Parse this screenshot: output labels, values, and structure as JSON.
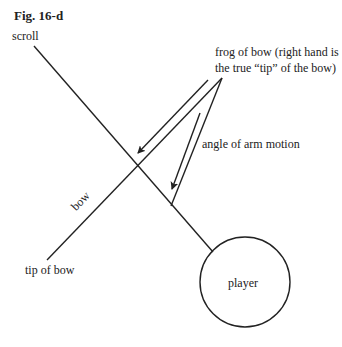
{
  "figure": {
    "title": "Fig. 16-d"
  },
  "labels": {
    "scroll": "scroll",
    "frog_line1": "frog of bow (right hand is",
    "frog_line2": "the true “tip” of the bow)",
    "angle": "angle of arm motion",
    "bow": "bow",
    "tip": "tip of bow",
    "player": "player"
  },
  "colors": {
    "stroke": "#222222",
    "background": "#ffffff"
  }
}
